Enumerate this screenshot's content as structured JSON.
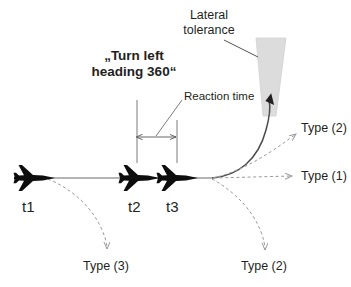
{
  "figure": {
    "kind": "aviation-trajectory-diagram",
    "background_color": "#ffffff",
    "ink_color": "#231f20",
    "dashed_color": "#9a9a9a",
    "cone_color": "#dcdcdc"
  },
  "labels": {
    "lateral_tolerance": "Lateral\ntolerance",
    "clearance_command": "„Turn left\nheading 360“",
    "reaction_time": "Reaction time",
    "time_t1": "t1",
    "time_t2": "t2",
    "time_t3": "t3",
    "type_1": "Type (1)",
    "type_2_upper": "Type (2)",
    "type_2_lower": "Type (2)",
    "type_3": "Type (3)"
  },
  "aircraft": [
    {
      "name": "aircraft-t1",
      "label": "t1",
      "x": 35,
      "y": 178
    },
    {
      "name": "aircraft-t2",
      "label": "t2",
      "x": 140,
      "y": 178
    },
    {
      "name": "aircraft-t3",
      "label": "t3",
      "x": 178,
      "y": 178
    }
  ],
  "elements": {
    "track_line": "solid horizontal ground track from t1 through t3",
    "turn_curve": "solid curve from t3 turning left up into lateral tolerance cone",
    "dimension_arrow": "double headed horizontal arrow between t2 and t3 extension lines",
    "cone": "grey tapered lateral tolerance funnel",
    "leader_line": "line from Lateral tolerance text to cone"
  }
}
